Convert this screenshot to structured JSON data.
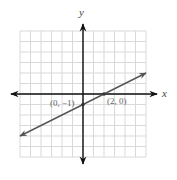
{
  "chart_data": {
    "type": "line",
    "title": "",
    "xlabel": "x",
    "ylabel": "y",
    "xlim": [
      -6,
      6
    ],
    "ylim": [
      -6,
      6
    ],
    "grid": true,
    "grid_step": 1,
    "series": [
      {
        "name": "line through (0, -1) and (2, 0)",
        "equation": "y = 0.5x - 1",
        "slope": 0.5,
        "intercept": -1,
        "x": [
          -6,
          6
        ],
        "y": [
          -4,
          2
        ],
        "arrows_both_ends": true
      }
    ],
    "points": [
      {
        "x": 0,
        "y": -1,
        "label": "(0, −1)"
      },
      {
        "x": 2,
        "y": 0,
        "label": "(2, 0)"
      }
    ],
    "annotations": [
      "(0, −1)",
      "(2, 0)"
    ]
  },
  "axes": {
    "x_label": "x",
    "y_label": "y"
  },
  "labels": {
    "point_a": "(0, −1)",
    "point_b": "(2, 0)"
  },
  "colors": {
    "grid": "#d9d9d9",
    "axis": "#111111",
    "line": "#555555",
    "label": "#666666"
  }
}
